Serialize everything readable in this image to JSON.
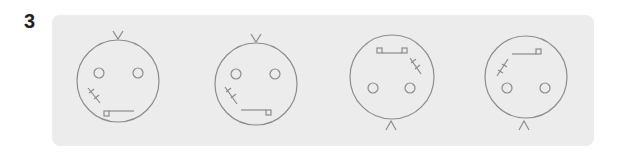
{
  "question": {
    "number": "3"
  },
  "colors": {
    "panel_bg": "#ececec",
    "stroke": "#8c8c8c",
    "number": "#222222"
  },
  "faces": [
    {
      "id": 1,
      "orientation": "upright",
      "hair": "top",
      "scar": "lower-left",
      "mouth_square": "left"
    },
    {
      "id": 2,
      "orientation": "upright",
      "hair": "top",
      "scar": "lower-left",
      "mouth_square": "right"
    },
    {
      "id": 3,
      "orientation": "upside-down",
      "hair": "bottom",
      "scar": "upper-right",
      "mouth_square": "both"
    },
    {
      "id": 4,
      "orientation": "upside-down",
      "hair": "bottom",
      "scar": "upper-left",
      "mouth_square": "right"
    }
  ]
}
